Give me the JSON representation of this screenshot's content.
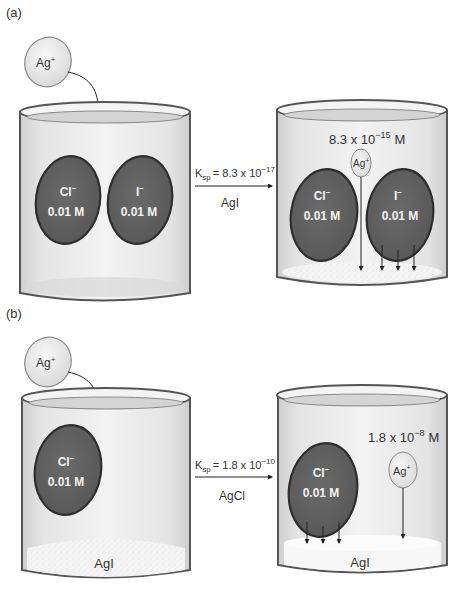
{
  "panels": [
    {
      "label": "(a)",
      "added_ion": "Ag",
      "added_ion_charge": "+",
      "before_beaker": {
        "ions": [
          {
            "symbol": "Cl",
            "charge": "−",
            "concentration": "0.01 M"
          },
          {
            "symbol": "I",
            "charge": "−",
            "concentration": "0.01 M"
          }
        ],
        "precipitate": ""
      },
      "reaction": {
        "k_symbol": "K",
        "k_subscript": "sp",
        "k_value": "= 8.3 x 10",
        "k_exponent": "−17",
        "compound": "AgI"
      },
      "after_beaker": {
        "ag_concentration": "8.3 x 10",
        "ag_concentration_exponent": "−15",
        "ag_concentration_unit": "M",
        "ag_ion": "Ag",
        "ag_ion_charge": "+",
        "ions": [
          {
            "symbol": "Cl",
            "charge": "−",
            "concentration": "0.01 M"
          },
          {
            "symbol": "I",
            "charge": "−",
            "concentration": "0.01 M"
          }
        ],
        "precipitate": ""
      }
    },
    {
      "label": "(b)",
      "added_ion": "Ag",
      "added_ion_charge": "+",
      "before_beaker": {
        "ions": [
          {
            "symbol": "Cl",
            "charge": "−",
            "concentration": "0.01 M"
          }
        ],
        "precipitate": "AgI"
      },
      "reaction": {
        "k_symbol": "K",
        "k_subscript": "sp",
        "k_value": "= 1.8 x 10",
        "k_exponent": "−10",
        "compound": "AgCl"
      },
      "after_beaker": {
        "ag_concentration": "1.8 x 10",
        "ag_concentration_exponent": "−8",
        "ag_concentration_unit": "M",
        "ag_ion": "Ag",
        "ag_ion_charge": "+",
        "ions": [
          {
            "symbol": "Cl",
            "charge": "−",
            "concentration": "0.01 M"
          }
        ],
        "precipitate": "AgI"
      }
    }
  ],
  "colors": {
    "ion_disc": "#5f5f5f",
    "ion_disc_edge": "#2e2e2e",
    "ag_disc": "#e8e8e8",
    "beaker_fill": "#e2e2e2",
    "beaker_edge": "#555555",
    "precipitate": "#f7f7f7"
  }
}
